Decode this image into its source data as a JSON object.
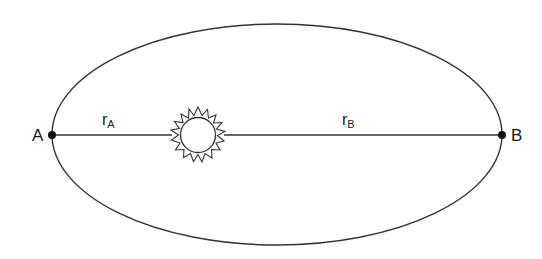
{
  "diagram": {
    "type": "elliptical-orbit",
    "stroke_color": "#333333",
    "background": "#ffffff",
    "points": {
      "a": {
        "label": "A"
      },
      "b": {
        "label": "B"
      }
    },
    "radii": {
      "ra": {
        "symbol": "r",
        "subscript": "A"
      },
      "rb": {
        "symbol": "r",
        "subscript": "B"
      }
    },
    "focus_object": "sun-icon"
  }
}
